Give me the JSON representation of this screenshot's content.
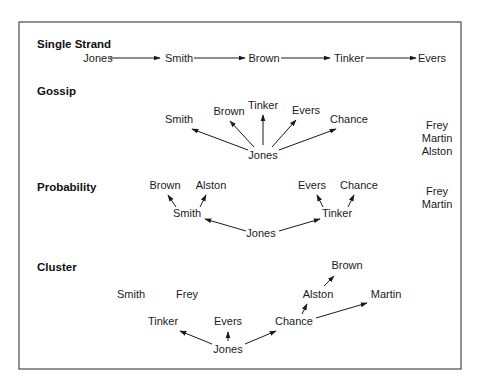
{
  "diagram": {
    "frame": {
      "x": 19,
      "y": 22,
      "width": 442,
      "height": 347
    },
    "colors": {
      "text": "#1a1a1a",
      "frame": "#4a4a4a",
      "background": "#ffffff"
    },
    "sections": [
      {
        "title": "Single Strand",
        "title_pos": [
          37,
          48
        ],
        "nodes": [
          {
            "id": "jones",
            "label": "Jones",
            "x": 98,
            "y": 62
          },
          {
            "id": "smith",
            "label": "Smith",
            "x": 179,
            "y": 62
          },
          {
            "id": "brown",
            "label": "Brown",
            "x": 264,
            "y": 62
          },
          {
            "id": "tinker",
            "label": "Tinker",
            "x": 349,
            "y": 62
          },
          {
            "id": "evers",
            "label": "Evers",
            "x": 432,
            "y": 62
          }
        ],
        "edges": [
          {
            "from": [
              110,
              58
            ],
            "to": [
              160,
              58
            ]
          },
          {
            "from": [
              194,
              58
            ],
            "to": [
              245,
              58
            ]
          },
          {
            "from": [
              281,
              58
            ],
            "to": [
              330,
              58
            ]
          },
          {
            "from": [
              366,
              58
            ],
            "to": [
              416,
              58
            ]
          }
        ]
      },
      {
        "title": "Gossip",
        "title_pos": [
          37,
          95
        ],
        "nodes": [
          {
            "id": "smith",
            "label": "Smith",
            "x": 179,
            "y": 123
          },
          {
            "id": "brown",
            "label": "Brown",
            "x": 229,
            "y": 115
          },
          {
            "id": "tinker",
            "label": "Tinker",
            "x": 263,
            "y": 109
          },
          {
            "id": "evers",
            "label": "Evers",
            "x": 306,
            "y": 114
          },
          {
            "id": "chance",
            "label": "Chance",
            "x": 349,
            "y": 123
          },
          {
            "id": "jones",
            "label": "Jones",
            "x": 263,
            "y": 159
          }
        ],
        "edges": [
          {
            "from": [
              248,
              150
            ],
            "to": [
              192,
              129
            ]
          },
          {
            "from": [
              254,
              147
            ],
            "to": [
              230,
              121
            ]
          },
          {
            "from": [
              263,
              145
            ],
            "to": [
              263,
              115
            ]
          },
          {
            "from": [
              272,
              147
            ],
            "to": [
              296,
              120
            ]
          },
          {
            "from": [
              279,
              150
            ],
            "to": [
              336,
              129
            ]
          }
        ],
        "isolates": {
          "labels": [
            "Frey",
            "Martin",
            "Alston"
          ],
          "x": 437,
          "y": [
            129,
            142,
            155
          ]
        }
      },
      {
        "title": "Probability",
        "title_pos": [
          37,
          191
        ],
        "nodes": [
          {
            "id": "brown",
            "label": "Brown",
            "x": 165,
            "y": 189
          },
          {
            "id": "alston",
            "label": "Alston",
            "x": 211,
            "y": 189
          },
          {
            "id": "smith",
            "label": "Smith",
            "x": 187,
            "y": 217
          },
          {
            "id": "evers",
            "label": "Evers",
            "x": 312,
            "y": 189
          },
          {
            "id": "chance",
            "label": "Chance",
            "x": 359,
            "y": 189
          },
          {
            "id": "tinker",
            "label": "Tinker",
            "x": 337,
            "y": 217
          },
          {
            "id": "jones",
            "label": "Jones",
            "x": 261,
            "y": 237
          }
        ],
        "edges": [
          {
            "from": [
              176,
              207
            ],
            "to": [
              168,
              195
            ]
          },
          {
            "from": [
              200,
              207
            ],
            "to": [
              206,
              195
            ]
          },
          {
            "from": [
              246,
              231
            ],
            "to": [
              205,
              219
            ]
          },
          {
            "from": [
              279,
              231
            ],
            "to": [
              320,
              219
            ]
          },
          {
            "from": [
              323,
              207
            ],
            "to": [
              317,
              195
            ]
          },
          {
            "from": [
              348,
              207
            ],
            "to": [
              354,
              195
            ]
          }
        ],
        "isolates": {
          "labels": [
            "Frey",
            "Martin"
          ],
          "x": 437,
          "y": [
            195,
            208
          ]
        }
      },
      {
        "title": "Cluster",
        "title_pos": [
          37,
          271
        ],
        "nodes": [
          {
            "id": "smith",
            "label": "Smith",
            "x": 131,
            "y": 298
          },
          {
            "id": "frey",
            "label": "Frey",
            "x": 187,
            "y": 298
          },
          {
            "id": "brown",
            "label": "Brown",
            "x": 347,
            "y": 269
          },
          {
            "id": "alston",
            "label": "Alston",
            "x": 318,
            "y": 298
          },
          {
            "id": "martin",
            "label": "Martin",
            "x": 386,
            "y": 298
          },
          {
            "id": "tinker",
            "label": "Tinker",
            "x": 163,
            "y": 325
          },
          {
            "id": "evers",
            "label": "Evers",
            "x": 228,
            "y": 325
          },
          {
            "id": "chance",
            "label": "Chance",
            "x": 294,
            "y": 325
          },
          {
            "id": "jones",
            "label": "Jones",
            "x": 228,
            "y": 353
          }
        ],
        "edges": [
          {
            "from": [
              212,
              344
            ],
            "to": [
              180,
              331
            ]
          },
          {
            "from": [
              228,
              341
            ],
            "to": [
              228,
              332
            ]
          },
          {
            "from": [
              245,
              344
            ],
            "to": [
              276,
              331
            ]
          },
          {
            "from": [
              302,
              314
            ],
            "to": [
              307,
              304
            ]
          },
          {
            "from": [
              324,
              286
            ],
            "to": [
              334,
              276
            ]
          },
          {
            "from": [
              316,
              318
            ],
            "to": [
              367,
              303
            ]
          }
        ]
      }
    ]
  }
}
